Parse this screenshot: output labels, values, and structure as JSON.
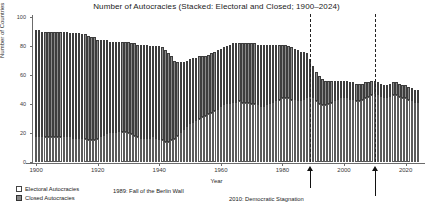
{
  "chart_data": {
    "type": "bar",
    "stacked": true,
    "title": "Number of Autocracies (Stacked: Electoral and Closed; 1900–2024)",
    "xlabel": "Year",
    "ylabel": "Number of Countries",
    "xlim": [
      1899,
      2025
    ],
    "ylim": [
      0,
      100
    ],
    "yticks": [
      0,
      20,
      40,
      60,
      80,
      100
    ],
    "xticks": [
      1900,
      1920,
      1940,
      1960,
      1980,
      2000,
      2020
    ],
    "grid": false,
    "legend_position": "below-left",
    "series": [
      {
        "name": "Electoral Autocracies",
        "color": "#ffffff",
        "values": [
          17,
          17,
          17,
          17,
          17,
          17,
          17,
          17,
          17,
          17,
          17,
          17,
          16,
          16,
          16,
          16,
          16,
          15,
          15,
          15,
          16,
          17,
          18,
          19,
          20,
          20,
          20,
          21,
          21,
          21,
          20,
          19,
          18,
          17,
          16,
          16,
          16,
          16,
          17,
          16,
          15,
          15,
          14,
          14,
          15,
          16,
          18,
          20,
          22,
          24,
          26,
          27,
          28,
          30,
          31,
          32,
          33,
          34,
          35,
          36,
          38,
          39,
          40,
          40,
          41,
          41,
          42,
          41,
          41,
          41,
          40,
          40,
          39,
          38,
          38,
          39,
          40,
          41,
          42,
          43,
          44,
          44,
          44,
          43,
          43,
          42,
          42,
          43,
          44,
          45,
          44,
          42,
          40,
          39,
          39,
          40,
          41,
          42,
          43,
          44,
          44,
          44,
          43,
          43,
          42,
          42,
          43,
          44,
          45,
          46,
          47,
          46,
          45,
          44,
          44,
          45,
          46,
          46,
          45,
          44,
          44,
          43,
          42,
          41,
          41
        ]
      },
      {
        "name": "Closed Autocracies",
        "color": "#8a8a8a",
        "values": [
          74,
          74,
          73,
          73,
          73,
          73,
          73,
          73,
          73,
          73,
          73,
          72,
          73,
          73,
          73,
          72,
          72,
          72,
          71,
          71,
          68,
          67,
          66,
          65,
          63,
          63,
          63,
          62,
          62,
          62,
          63,
          63,
          64,
          64,
          65,
          65,
          65,
          64,
          63,
          64,
          65,
          64,
          63,
          61,
          58,
          54,
          51,
          49,
          47,
          46,
          45,
          45,
          44,
          43,
          42,
          41,
          41,
          41,
          41,
          41,
          40,
          40,
          40,
          41,
          41,
          41,
          40,
          41,
          41,
          41,
          42,
          42,
          42,
          43,
          43,
          42,
          41,
          40,
          39,
          38,
          37,
          37,
          36,
          36,
          35,
          35,
          34,
          33,
          31,
          26,
          22,
          20,
          19,
          18,
          17,
          16,
          15,
          14,
          13,
          12,
          12,
          12,
          12,
          12,
          12,
          12,
          11,
          11,
          10,
          10,
          9,
          9,
          9,
          9,
          9,
          9,
          9,
          9,
          9,
          9,
          9,
          9,
          9,
          9,
          9
        ]
      }
    ],
    "x": [
      1900,
      1901,
      1902,
      1903,
      1904,
      1905,
      1906,
      1907,
      1908,
      1909,
      1910,
      1911,
      1912,
      1913,
      1914,
      1915,
      1916,
      1917,
      1918,
      1919,
      1920,
      1921,
      1922,
      1923,
      1924,
      1925,
      1926,
      1927,
      1928,
      1929,
      1930,
      1931,
      1932,
      1933,
      1934,
      1935,
      1936,
      1937,
      1938,
      1939,
      1940,
      1941,
      1942,
      1943,
      1944,
      1945,
      1946,
      1947,
      1948,
      1949,
      1950,
      1951,
      1952,
      1953,
      1954,
      1955,
      1956,
      1957,
      1958,
      1959,
      1960,
      1961,
      1962,
      1963,
      1964,
      1965,
      1966,
      1967,
      1968,
      1969,
      1970,
      1971,
      1972,
      1973,
      1974,
      1975,
      1976,
      1977,
      1978,
      1979,
      1980,
      1981,
      1982,
      1983,
      1984,
      1985,
      1986,
      1987,
      1988,
      1989,
      1990,
      1991,
      1992,
      1993,
      1994,
      1995,
      1996,
      1997,
      1998,
      1999,
      2000,
      2001,
      2002,
      2003,
      2004,
      2005,
      2006,
      2007,
      2008,
      2009,
      2010,
      2011,
      2012,
      2013,
      2014,
      2015,
      2016,
      2017,
      2018,
      2019,
      2020,
      2021,
      2022,
      2023,
      2024
    ],
    "annotations": [
      {
        "x": 1989,
        "label": "1989: Fall of the Berlin Wall",
        "style": "dashed-vline-with-arrow"
      },
      {
        "x": 2010,
        "label": "2010: Democratic Stagnation",
        "style": "dashed-vline-with-arrow"
      }
    ]
  },
  "legend": {
    "items": [
      {
        "label": "Electoral Autocracies",
        "swatch": "open-square"
      },
      {
        "label": "Closed Autocracies",
        "swatch": "hatched-square"
      }
    ]
  }
}
